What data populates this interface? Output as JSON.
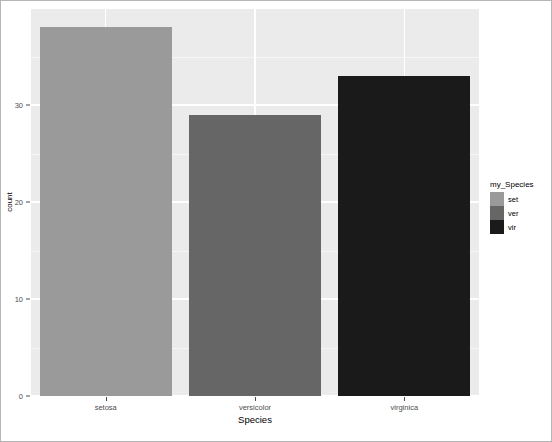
{
  "figure": {
    "background": "#ffffff",
    "panel_background": "#ebebeb",
    "gridline_color": "#ffffff",
    "border_color": "#b6b6b6"
  },
  "chart_data": {
    "type": "bar",
    "title": "",
    "subtitle": "",
    "xlabel": "Species",
    "ylabel": "count",
    "categories": [
      "setosa",
      "versicolor",
      "virginica"
    ],
    "values": [
      38,
      29,
      33
    ],
    "series": [
      {
        "name": "count",
        "values": [
          38,
          29,
          33
        ]
      }
    ],
    "bar_colors": [
      "#9a9a9a",
      "#666666",
      "#1a1a1a"
    ],
    "ylim": [
      0,
      39.9
    ],
    "ytick_labels": [
      "0",
      "10",
      "20",
      "30"
    ],
    "ytick_values": [
      0,
      10,
      20,
      30
    ],
    "yminor_values": [
      5,
      15,
      25,
      35
    ],
    "xtick_labels": [
      "setosa",
      "versicolor",
      "virginica"
    ],
    "grid": true,
    "legend_position": "right",
    "legend": {
      "title": "my_Species",
      "entries": [
        {
          "label": "set",
          "color": "#9a9a9a"
        },
        {
          "label": "ver",
          "color": "#666666"
        },
        {
          "label": "vir",
          "color": "#1a1a1a"
        }
      ]
    }
  }
}
